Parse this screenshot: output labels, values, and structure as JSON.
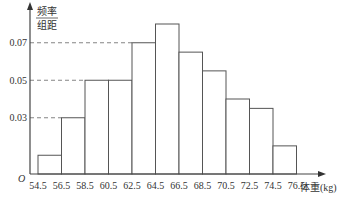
{
  "chart_data": {
    "type": "bar",
    "subtype": "histogram",
    "title": "",
    "xlabel": "体重(kg)",
    "ylabel_numerator": "频率",
    "ylabel_denominator": "组距",
    "origin_label": "O",
    "bin_edges": [
      54.5,
      56.5,
      58.5,
      60.5,
      62.5,
      64.5,
      66.5,
      68.5,
      70.5,
      72.5,
      74.5,
      76.5
    ],
    "categories": [
      "54.5-56.5",
      "56.5-58.5",
      "58.5-60.5",
      "60.5-62.5",
      "62.5-64.5",
      "64.5-66.5",
      "66.5-68.5",
      "68.5-70.5",
      "70.5-72.5",
      "72.5-74.5",
      "74.5-76.5"
    ],
    "values": [
      0.01,
      0.03,
      0.05,
      0.05,
      0.07,
      0.08,
      0.065,
      0.055,
      0.04,
      0.035,
      0.015
    ],
    "y_ticks": [
      0.03,
      0.05,
      0.07
    ],
    "x_tick_labels": [
      "54.5",
      "56.5",
      "58.5",
      "60.5",
      "62.5",
      "64.5",
      "66.5",
      "68.5",
      "70.5",
      "72.5",
      "74.5",
      "76.5"
    ],
    "ylim": [
      0,
      0.09
    ],
    "grid": false,
    "dashed_reference_lines": [
      0.03,
      0.05,
      0.07
    ]
  }
}
